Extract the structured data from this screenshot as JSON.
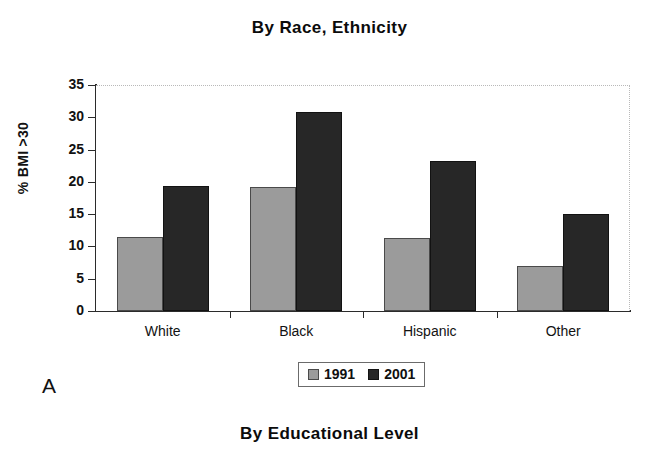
{
  "figure": {
    "panel_letter": "A",
    "next_panel_title": "By Educational Level"
  },
  "chart_data": {
    "type": "bar",
    "title": "By Race, Ethnicity",
    "xlabel": "",
    "ylabel": "% BMI >30",
    "categories": [
      "White",
      "Black",
      "Hispanic",
      "Other"
    ],
    "series": [
      {
        "name": "1991",
        "color": "#9b9b9b",
        "values": [
          11.4,
          19.2,
          11.3,
          7.0
        ]
      },
      {
        "name": "2001",
        "color": "#272727",
        "values": [
          19.4,
          30.8,
          23.2,
          15.1
        ]
      }
    ],
    "ylim": [
      0,
      35
    ],
    "ytick_labels": [
      "35",
      "30",
      "25",
      "20",
      "15",
      "10",
      "5",
      "0"
    ],
    "ytick_values": [
      35,
      30,
      25,
      20,
      15,
      10,
      5,
      0
    ],
    "grid": false,
    "legend_position": "bottom-center"
  }
}
